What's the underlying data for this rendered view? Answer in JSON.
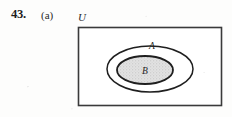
{
  "exercise": {
    "number": "43.",
    "part": "(a)"
  },
  "diagram": {
    "type": "venn-diagram",
    "universal_set_label": "U",
    "outer_set_label": "A",
    "inner_set_label": "B",
    "relationship": "B is a proper subset of A, and A is a subset of U",
    "shaded_region": "B",
    "colors": {
      "ink": "#1f1f1f",
      "rectangle_stroke": "#3a3a3a",
      "shading_fill": "#dcdcdc",
      "page_background": "#fdfdfc"
    },
    "geometry": {
      "rectangle": {
        "x": 78,
        "y": 27,
        "width": 144,
        "height": 79
      },
      "outer_ellipse": {
        "cx": 150,
        "cy": 69,
        "rx": 43,
        "ry": 23
      },
      "inner_ellipse": {
        "cx": 145,
        "cy": 70,
        "rx": 28,
        "ry": 14
      }
    }
  }
}
